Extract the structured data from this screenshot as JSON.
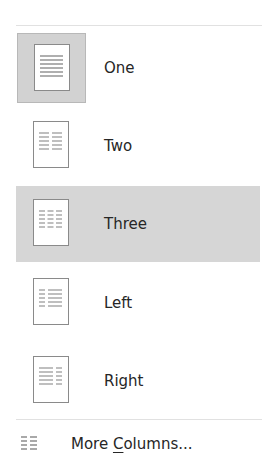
{
  "menu": {
    "title": "Columns",
    "items": [
      {
        "id": "one",
        "label": "One",
        "icon": "one-column-icon",
        "selected": true,
        "hovered": false,
        "layout": "one"
      },
      {
        "id": "two",
        "label": "Two",
        "icon": "two-columns-icon",
        "selected": false,
        "hovered": false,
        "layout": "two"
      },
      {
        "id": "three",
        "label": "Three",
        "icon": "three-columns-icon",
        "selected": false,
        "hovered": true,
        "layout": "three"
      },
      {
        "id": "left",
        "label": "Left",
        "icon": "left-column-icon",
        "selected": false,
        "hovered": false,
        "layout": "left"
      },
      {
        "id": "right",
        "label": "Right",
        "icon": "right-column-icon",
        "selected": false,
        "hovered": false,
        "layout": "right"
      }
    ],
    "more": {
      "label_before": "More ",
      "label_accesskey": "C",
      "label_after": "olumns...",
      "full_label": "More Columns...",
      "icon": "columns-icon"
    }
  },
  "colors": {
    "hover_background": "#d6d6d6",
    "selected_background": "#d2d2d2",
    "text": "#262626",
    "separator": "#e1e1e1"
  }
}
